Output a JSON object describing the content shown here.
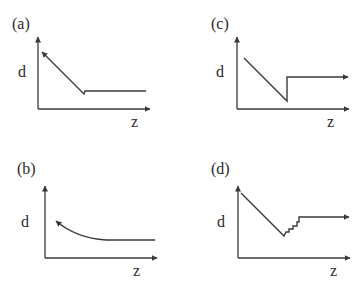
{
  "panels": [
    {
      "id": "a",
      "label": "(a)",
      "y_axis_label": "d",
      "x_axis_label": "z",
      "description": "Linear decrease toward origin (arrow points up-left), reaching a minimum, then constant plateau"
    },
    {
      "id": "c",
      "label": "(c)",
      "y_axis_label": "d",
      "x_axis_label": "z",
      "description": "Linear decrease to a minimum, abrupt vertical jump, then constant plateau (arrow points right)"
    },
    {
      "id": "b",
      "label": "(b)",
      "y_axis_label": "d",
      "x_axis_label": "z",
      "description": "Smooth exponential-like decay curve (arrow points up-left) flattening into a constant plateau"
    },
    {
      "id": "d",
      "label": "(d)",
      "y_axis_label": "d",
      "x_axis_label": "z",
      "description": "Linear decrease to a minimum, staircase (stepwise) increase, then constant plateau (arrow points right)"
    }
  ]
}
